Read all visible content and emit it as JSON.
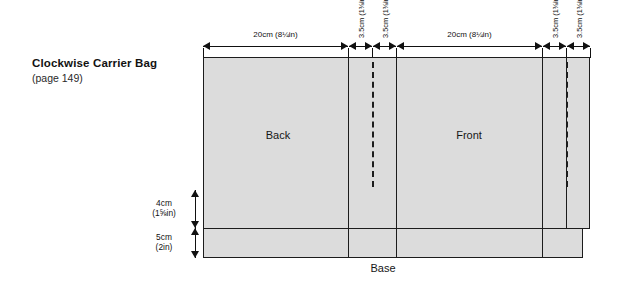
{
  "title_block": {
    "main_title": "Clockwise Carrier Bag",
    "sub_title": "(page 149)"
  },
  "panels": {
    "back_label": "Back",
    "front_label": "Front",
    "base_label": "Base"
  },
  "dimensions": {
    "top": [
      {
        "id": "back-width",
        "value_cm": "20cm",
        "value_in": "(8¼in)"
      },
      {
        "id": "back-gusset-left",
        "value_cm": "3.5cm",
        "value_in": "(1⅜in)"
      },
      {
        "id": "back-gusset-right",
        "value_cm": "3.5cm",
        "value_in": "(1⅜in)"
      },
      {
        "id": "front-width",
        "value_cm": "20cm",
        "value_in": "(8¼in)"
      },
      {
        "id": "front-gusset-left",
        "value_cm": "3.5cm",
        "value_in": "(1⅜in)"
      },
      {
        "id": "front-gusset-right",
        "value_cm": "3.5cm",
        "value_in": "(1⅜in)"
      }
    ],
    "left": [
      {
        "id": "hem-allowance",
        "value_cm": "4cm",
        "value_in": "(1⅝in)"
      },
      {
        "id": "base-depth",
        "value_cm": "5cm",
        "value_in": "(2in)"
      }
    ]
  },
  "colors": {
    "fabric_fill": "#dcdcdc",
    "line": "#1c1c1c",
    "text": "#121212"
  }
}
